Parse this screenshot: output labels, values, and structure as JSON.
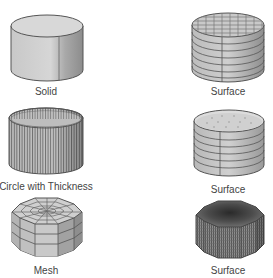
{
  "figures": [
    {
      "id": "solid",
      "label": "Solid"
    },
    {
      "id": "surface-grid",
      "label": "Surface"
    },
    {
      "id": "circle-thickness",
      "label": "Circle with Thickness"
    },
    {
      "id": "surface-open",
      "label": "Surface"
    },
    {
      "id": "mesh",
      "label": "Mesh"
    },
    {
      "id": "surface-dense",
      "label": "Surface"
    }
  ],
  "colors": {
    "background": "#ffffff",
    "fill_light": "#d4d4d4",
    "fill_mid": "#bdbdbd",
    "fill_dark": "#8a8a8a",
    "outline": "#555555",
    "label": "#444444"
  }
}
